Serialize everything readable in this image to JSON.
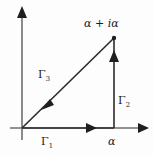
{
  "figure": {
    "kind": "complex-plane-contour-diagram",
    "stroke_color": "#2b2b2b",
    "background_color": "#fdfdfd",
    "labels": {
      "vertex_point": "α + iα",
      "contour_1": "Γ",
      "contour_1_index": "1",
      "contour_2": "Γ",
      "contour_2_index": "2",
      "contour_3": "Γ",
      "contour_3_index": "3",
      "x_tick_alpha": "α"
    },
    "geometry": {
      "origin": [
        22,
        128
      ],
      "vertex_alpha": [
        114,
        128
      ],
      "vertex_alpha_plus_i_alpha": [
        114,
        38
      ],
      "y_axis_arrow_tip": [
        22,
        8
      ],
      "x_axis_arrow_tip": [
        147,
        128
      ],
      "gamma1_arrow_at": [
        91,
        128
      ],
      "gamma2_arrow_at": [
        114,
        58
      ],
      "gamma3_arrow_at": [
        47,
        104
      ]
    }
  }
}
